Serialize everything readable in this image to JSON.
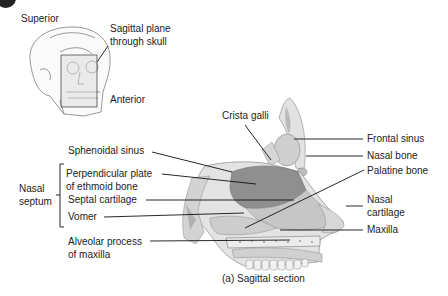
{
  "figure": {
    "badge_color": "#222222",
    "caption": "(a) Sagittal section"
  },
  "inset": {
    "orientation_superior": "Superior",
    "orientation_anterior": "Anterior",
    "plane_label_line1": "Sagittal plane",
    "plane_label_line2": "through skull"
  },
  "labels": {
    "left": {
      "sphenoidal_sinus": "Sphenoidal sinus",
      "perpendicular_plate_line1": "Perpendicular plate",
      "perpendicular_plate_line2": "of ethmoid bone",
      "septal_cartilage": "Septal cartilage",
      "vomer": "Vomer",
      "alveolar_line1": "Alveolar process",
      "alveolar_line2": "of maxilla",
      "group_line1": "Nasal",
      "group_line2": "septum"
    },
    "top": {
      "crista_galli": "Crista galli"
    },
    "right": {
      "frontal_sinus": "Frontal sinus",
      "nasal_bone": "Nasal bone",
      "palatine_bone": "Palatine bone",
      "nasal_cartilage_line1": "Nasal",
      "nasal_cartilage_line2": "cartilage",
      "maxilla": "Maxilla"
    }
  },
  "colors": {
    "bone_light": "#e4e4e4",
    "bone_mid": "#c8c8c8",
    "plate_dark": "#8f8f8f",
    "cartilage": "#bdbdbd",
    "outline": "#7a7a7a"
  }
}
